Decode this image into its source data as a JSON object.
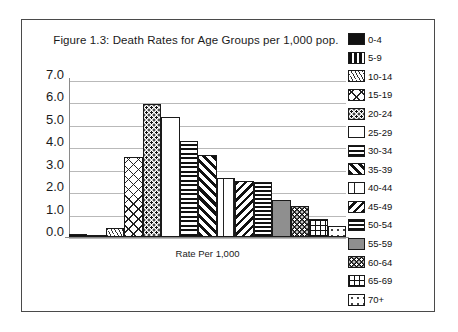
{
  "figure": {
    "title": "Figure 1.3: Death Rates for Age Groups per 1,000 pop.",
    "xaxis_label": "Rate Per 1,000"
  },
  "chart_data": {
    "type": "bar",
    "title": "Figure 1.3: Death Rates for Age Groups per 1,000 pop.",
    "xlabel": "Rate Per 1,000",
    "ylabel": "",
    "ylim": [
      0.0,
      7.0
    ],
    "ytick_labels": [
      "7.0",
      "6.0",
      "5.0",
      "4.0",
      "3.0",
      "2.0",
      "1.0",
      "0.0"
    ],
    "ytick_values": [
      7.0,
      6.0,
      5.0,
      4.0,
      3.0,
      2.0,
      1.0,
      0.0
    ],
    "grid": true,
    "legend_position": "right",
    "categories": [
      "0-4",
      "5-9",
      "10-14",
      "15-19",
      "20-24",
      "25-29",
      "30-34",
      "35-39",
      "40-44",
      "45-49",
      "50-54",
      "55-59",
      "60-64",
      "65-69",
      "70+"
    ],
    "values": [
      0.15,
      0.1,
      0.4,
      3.55,
      5.95,
      5.35,
      4.3,
      3.65,
      2.65,
      2.5,
      2.45,
      1.65,
      1.4,
      0.8,
      0.5
    ],
    "series": [
      {
        "name": "Death rate per 1,000 population",
        "values": [
          0.15,
          0.1,
          0.4,
          3.55,
          5.95,
          5.35,
          4.3,
          3.65,
          2.65,
          2.5,
          2.45,
          1.65,
          1.4,
          0.8,
          0.5
        ]
      }
    ],
    "patterns": [
      "solid-black",
      "vertical-thick-stripes",
      "thin-diagonal-stripes",
      "sparse-crosshatch",
      "dense-dots",
      "empty-white",
      "horizontal-thick-stripes",
      "wide-diagonal-stripes",
      "vertical-dashed",
      "backward-diagonal-stripes",
      "horizontal-lines",
      "solid-gray",
      "black-with-white-dots",
      "grid-crosshatch",
      "sparse-dots"
    ]
  },
  "legend": {
    "items": [
      {
        "label": "0-4",
        "pattern": "pat-solid-black"
      },
      {
        "label": "5-9",
        "pattern": "pat-vert-thick"
      },
      {
        "label": "10-14",
        "pattern": "pat-diag-thin"
      },
      {
        "label": "15-19",
        "pattern": "pat-crosshatch-sparse"
      },
      {
        "label": "20-24",
        "pattern": "pat-dots-dense"
      },
      {
        "label": "25-29",
        "pattern": "pat-empty"
      },
      {
        "label": "30-34",
        "pattern": "pat-horz-thick"
      },
      {
        "label": "35-39",
        "pattern": "pat-diag-wide"
      },
      {
        "label": "40-44",
        "pattern": "pat-vert-dashed"
      },
      {
        "label": "45-49",
        "pattern": "pat-diag-back"
      },
      {
        "label": "50-54",
        "pattern": "pat-horz-lines"
      },
      {
        "label": "55-59",
        "pattern": "pat-solid-gray"
      },
      {
        "label": "60-64",
        "pattern": "pat-black-dots"
      },
      {
        "label": "65-69",
        "pattern": "pat-grid"
      },
      {
        "label": "70+",
        "pattern": "pat-dots-sparse"
      }
    ]
  },
  "colors": {
    "frame_border": "#4a4a4a",
    "gridline": "#b9b9b9",
    "axis": "#8a8a8a",
    "text": "#1a1a1a",
    "bar_outline": "#1a1a1a",
    "gray_fill": "#8f8f8f",
    "black_fill": "#111111",
    "background": "#ffffff"
  }
}
